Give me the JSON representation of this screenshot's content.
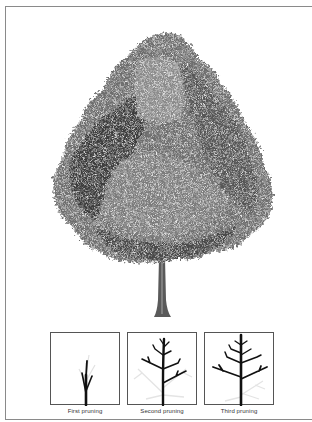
{
  "figure": {
    "main_illustration": "mature deciduous tree",
    "colors": {
      "foliage_dark": "#3a3a3a",
      "foliage_mid": "#6e6e6e",
      "foliage_light": "#a8a8a8",
      "trunk": "#5a5a5a",
      "border": "#8a8a8a"
    },
    "panels": [
      {
        "caption": "First pruning"
      },
      {
        "caption": "Second pruning"
      },
      {
        "caption": "Third pruning"
      }
    ]
  }
}
